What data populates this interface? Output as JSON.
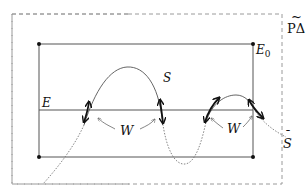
{
  "diagram": {
    "labels": {
      "region": "PΔ",
      "region_tilde": "~",
      "top_right_corner": "E",
      "top_right_corner_sub": "0",
      "horizontal_line": "E",
      "curve": "S",
      "curve_extension": "S",
      "curve_extension_accent": "¯",
      "window_left": "W",
      "window_right": "W"
    },
    "colors": {
      "line": "#444444",
      "dashed_border": "#9a9a9a",
      "curve": "#555555",
      "thick_arrow": "#111111",
      "thin_arrow": "#666666"
    },
    "elements": [
      "dashed outer boundary labeled PΔ with tilde",
      "solid inner rectangle with corner points, top-right labeled E0",
      "horizontal line labeled E",
      "curve S crossing line E, solid inside region and dotted outside",
      "dotted extension of curve labeled S-bar",
      "four thick double-headed arrows at crossings of S with E",
      "two W labels with thin arrows pointing to crossing arrows"
    ]
  }
}
